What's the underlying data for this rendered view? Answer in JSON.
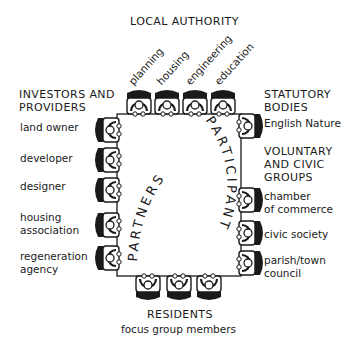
{
  "groups": {
    "local_authority": {
      "title": "LOCAL AUTHORITY",
      "members": [
        "planning",
        "housing",
        "engineering",
        "education"
      ]
    },
    "investors_providers": {
      "title_line1": "INVESTORS AND",
      "title_line2": "PROVIDERS",
      "members": [
        "land owner",
        "developer",
        "designer",
        "housing",
        "association",
        "regeneration",
        "agency"
      ]
    },
    "statutory_bodies": {
      "title_line1": "STATUTORY",
      "title_line2": "BODIES",
      "members": [
        "English Nature"
      ]
    },
    "voluntary_civic": {
      "title_line1": "VOLUNTARY",
      "title_line2": "AND CIVIC",
      "title_line3": "GROUPS",
      "members": [
        "chamber",
        "of commerce",
        "civic society",
        "parish/town",
        "council"
      ]
    },
    "residents": {
      "title": "RESIDENTS",
      "subtitle": "focus group members"
    }
  },
  "table": {
    "left_arc_label": "PARTNERS",
    "right_arc_label": "PARTICIPANT"
  },
  "colors": {
    "ink": "#1a1a1a",
    "background": "#ffffff"
  }
}
